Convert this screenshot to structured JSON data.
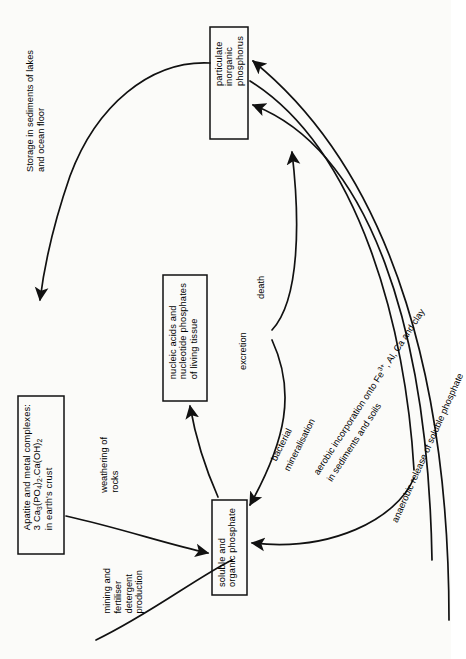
{
  "diagram": {
    "boxes": [
      {
        "id": "particulate",
        "lines": [
          "particulate",
          "inorganic",
          "phosphorus"
        ]
      },
      {
        "id": "apatite",
        "lines": [
          "Apatite and metal complexes:",
          "3 Ca3(PO4)2.Ca(OH)2",
          "in earth's crust"
        ]
      },
      {
        "id": "nucleic",
        "lines": [
          "nucleic acids and",
          "nucleotide phosphates",
          "of living tissue"
        ]
      },
      {
        "id": "soluble",
        "lines": [
          "soluble and",
          "organic phosphate"
        ]
      }
    ],
    "labels": [
      {
        "id": "storage",
        "lines": [
          "Storage in sediments of lakes",
          "and ocean floor"
        ]
      },
      {
        "id": "weathering",
        "lines": [
          "weathering of",
          "rocks"
        ]
      },
      {
        "id": "mining",
        "lines": [
          "mining and",
          "fertiliser",
          "detergent",
          "production"
        ]
      },
      {
        "id": "death",
        "lines": [
          "death"
        ]
      },
      {
        "id": "excretion",
        "lines": [
          "excretion"
        ]
      },
      {
        "id": "bacterial",
        "lines": [
          "bacterial",
          "mineralisation"
        ]
      },
      {
        "id": "aerobic",
        "lines": [
          "aerobic incorporation onto Fe3+, Al, Ca and clay",
          "in sediments and soils"
        ]
      },
      {
        "id": "anaerobic",
        "lines": [
          "anaerobic release of soluble phosphate"
        ]
      }
    ],
    "colors": {
      "ink": "#111111",
      "paper": "#fbfbf9"
    }
  }
}
